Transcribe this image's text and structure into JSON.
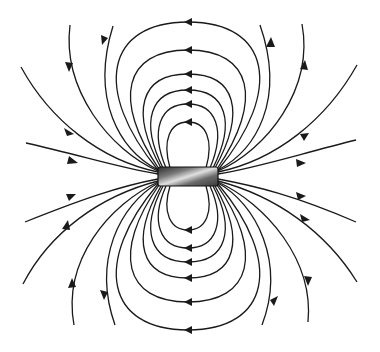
{
  "diagram": {
    "title": "Magnetic field lines of a bar magnet",
    "field_direction": "lines leave the right end of the magnet and re-enter at the left end",
    "closed_loops_above": 6,
    "closed_loops_below": 6,
    "open_lines_per_quadrant": 4,
    "colors": {
      "line": "#1a1a1a",
      "background": "#ffffff",
      "magnet_dark": "#2a2a2a",
      "magnet_light": "#d8d8d8"
    }
  }
}
